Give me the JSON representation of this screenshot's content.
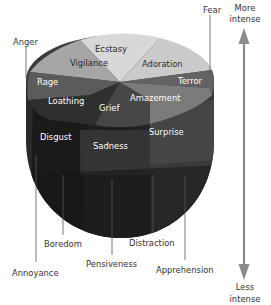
{
  "diagram": {
    "axis": {
      "top_label_line1": "More",
      "top_label_line2": "intense",
      "bottom_label_line1": "Less",
      "bottom_label_line2": "intense",
      "arrow_color": "#8a8a8a"
    },
    "top_ring_labels": {
      "vigilance": "Vigilance",
      "ecstasy": "Ecstasy",
      "adoration": "Adoration",
      "terror": "Terror",
      "amazement": "Amazement",
      "grief": "Grief",
      "loathing": "Loathing",
      "rage": "Rage"
    },
    "middle_labels": {
      "disgust": "Disgust",
      "sadness": "Sadness",
      "surprise": "Surprise"
    },
    "outer_labels": {
      "anger": "Anger",
      "fear": "Fear",
      "annoyance": "Annoyance",
      "boredom": "Boredom",
      "pensiveness": "Pensiveness",
      "distraction": "Distraction",
      "apprehension": "Apprehension"
    },
    "colors": {
      "ecstasy": "#d9d9d9",
      "adoration": "#cfcfcf",
      "vigilance": "#a9a9a9",
      "rage": "#5c5c5c",
      "loathing": "#3a3a3a",
      "grief": "#4a4a4a",
      "amazement": "#7a7a7a",
      "terror": "#666666",
      "body_dark": "#1f1f1f",
      "body_mid": "#2e2e2e"
    }
  }
}
